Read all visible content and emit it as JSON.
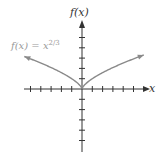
{
  "chart_data": {
    "type": "line",
    "title": "",
    "function": "f(x) = x^(2/3)",
    "xlabel": "x",
    "ylabel": "f(x)",
    "annotation": {
      "text_base": "f(x) = x",
      "exponent": "2/3"
    },
    "xlim": [
      -6,
      6
    ],
    "ylim": [
      -6,
      6
    ],
    "x_ticks": [
      -5,
      -4,
      -3,
      -2,
      -1,
      1,
      2,
      3,
      4,
      5
    ],
    "y_ticks": [
      -5,
      -4,
      -3,
      -2,
      -1,
      1,
      2,
      3,
      4,
      5
    ],
    "tick_labels_shown": false,
    "grid": false,
    "series": [
      {
        "name": "f(x) = x^(2/3)",
        "x": [
          -5.6,
          -4,
          -3,
          -2,
          -1,
          -0.5,
          0,
          0.5,
          1,
          2,
          3,
          4,
          6
        ],
        "y": [
          3.15,
          2.52,
          2.08,
          1.59,
          1.0,
          0.63,
          0,
          0.63,
          1.0,
          1.59,
          2.08,
          2.52,
          3.3
        ]
      }
    ],
    "colors": {
      "curve": "#8a8a8a",
      "axes": "#333333",
      "annotation": "#999999"
    }
  },
  "labels": {
    "y_axis": "f(x)",
    "x_axis": "x",
    "function_base": "f(x) = x",
    "function_exp": "2/3"
  }
}
